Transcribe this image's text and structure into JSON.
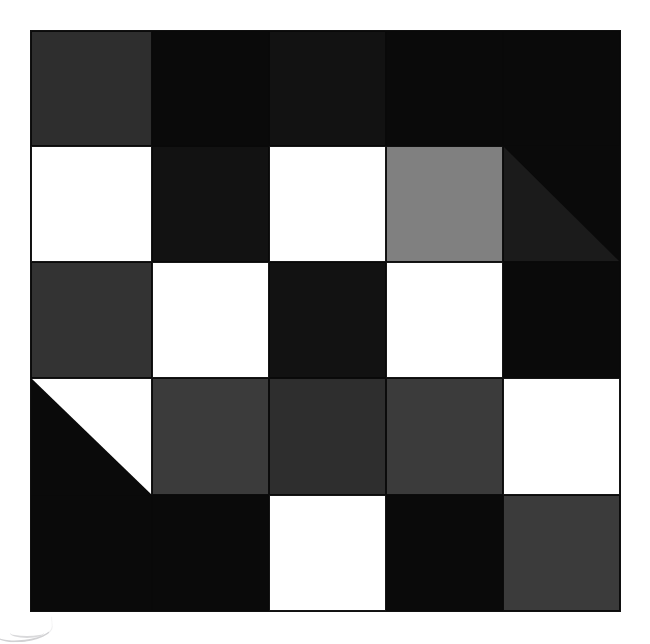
{
  "canvas": {
    "width": 650,
    "height": 644,
    "background": "#ffffff"
  },
  "block": {
    "label": "quilt-block",
    "rows": 5,
    "columns": 5,
    "sashing_color": "#0a0a0a",
    "origin": {
      "x": 31,
      "y": 31
    },
    "size": {
      "width": 589,
      "height": 580
    }
  },
  "palette": {
    "black": "#0a0a0a",
    "near_black": "#121212",
    "very_dark_gray": "#1b1b1b",
    "dark_gray": "#2e2e2e",
    "charcoal": "#333333",
    "slate_gray": "#3b3b3b",
    "medium_gray": "#808080",
    "white": "#ffffff"
  },
  "patches": [
    {
      "row": 1,
      "col": 1,
      "name": "patch-r1c1",
      "shape": "solid",
      "color": "#2e2e2e"
    },
    {
      "row": 1,
      "col": 2,
      "name": "patch-r1c2",
      "shape": "solid",
      "color": "#0a0a0a"
    },
    {
      "row": 1,
      "col": 3,
      "name": "patch-r1c3",
      "shape": "solid",
      "color": "#121212"
    },
    {
      "row": 1,
      "col": 4,
      "name": "patch-r1c4",
      "shape": "solid",
      "color": "#0a0a0a"
    },
    {
      "row": 1,
      "col": 5,
      "name": "patch-r1c5",
      "shape": "solid",
      "color": "#0a0a0a"
    },
    {
      "row": 2,
      "col": 1,
      "name": "patch-r2c1",
      "shape": "solid",
      "color": "#ffffff"
    },
    {
      "row": 2,
      "col": 2,
      "name": "patch-r2c2",
      "shape": "solid",
      "color": "#121212"
    },
    {
      "row": 2,
      "col": 3,
      "name": "patch-r2c3",
      "shape": "solid",
      "color": "#ffffff"
    },
    {
      "row": 2,
      "col": 4,
      "name": "patch-r2c4",
      "shape": "solid",
      "color": "#808080"
    },
    {
      "row": 2,
      "col": 5,
      "name": "patch-r2c5",
      "shape": "half-square-triangle",
      "color": "#0a0a0a",
      "color2": "#1b1b1b",
      "diagonal": "tl-br",
      "note": "upper-right black, lower-left very dark gray"
    },
    {
      "row": 3,
      "col": 1,
      "name": "patch-r3c1",
      "shape": "solid",
      "color": "#333333"
    },
    {
      "row": 3,
      "col": 2,
      "name": "patch-r3c2",
      "shape": "solid",
      "color": "#ffffff"
    },
    {
      "row": 3,
      "col": 3,
      "name": "patch-r3c3",
      "shape": "solid",
      "color": "#121212"
    },
    {
      "row": 3,
      "col": 4,
      "name": "patch-r3c4",
      "shape": "solid",
      "color": "#ffffff"
    },
    {
      "row": 3,
      "col": 5,
      "name": "patch-r3c5",
      "shape": "solid",
      "color": "#0a0a0a"
    },
    {
      "row": 4,
      "col": 1,
      "name": "patch-r4c1",
      "shape": "half-square-triangle",
      "color": "#0a0a0a",
      "color2": "#ffffff",
      "diagonal": "tl-br",
      "note": "lower-left black, upper-right white"
    },
    {
      "row": 4,
      "col": 2,
      "name": "patch-r4c2",
      "shape": "solid",
      "color": "#3b3b3b"
    },
    {
      "row": 4,
      "col": 3,
      "name": "patch-r4c3",
      "shape": "solid",
      "color": "#2e2e2e"
    },
    {
      "row": 4,
      "col": 4,
      "name": "patch-r4c4",
      "shape": "solid",
      "color": "#3b3b3b"
    },
    {
      "row": 4,
      "col": 5,
      "name": "patch-r4c5",
      "shape": "solid",
      "color": "#ffffff"
    },
    {
      "row": 5,
      "col": 1,
      "name": "patch-r5c1",
      "shape": "solid",
      "color": "#0a0a0a"
    },
    {
      "row": 5,
      "col": 2,
      "name": "patch-r5c2",
      "shape": "solid",
      "color": "#0a0a0a"
    },
    {
      "row": 5,
      "col": 3,
      "name": "patch-r5c3",
      "shape": "solid",
      "color": "#ffffff"
    },
    {
      "row": 5,
      "col": 4,
      "name": "patch-r5c4",
      "shape": "solid",
      "color": "#0a0a0a"
    },
    {
      "row": 5,
      "col": 5,
      "name": "patch-r5c5",
      "shape": "solid",
      "color": "#3b3b3b"
    }
  ],
  "artifacts": [
    {
      "name": "scan-arc-artifact",
      "description": "faint curved gray scanner mark at bottom-left corner"
    }
  ]
}
